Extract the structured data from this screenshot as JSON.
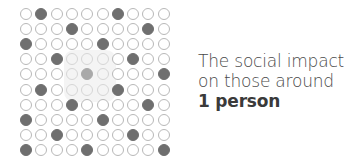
{
  "figure": {
    "grid": {
      "rows": 10,
      "cols": 10,
      "filled": [
        [
          2,
          7
        ],
        [
          4,
          9
        ],
        [
          1,
          6
        ],
        [
          3,
          8
        ],
        [
          10
        ],
        [
          2,
          7
        ],
        [
          4,
          9
        ],
        [
          1,
          6
        ],
        [
          3,
          8
        ],
        [
          1,
          5,
          10
        ]
      ],
      "highlighted_person": {
        "row": 5,
        "col": 5
      },
      "highlight_region": {
        "rows": [
          4,
          6
        ],
        "cols": [
          4,
          6
        ]
      },
      "colors": {
        "filled": "#6f6f6f",
        "outline": "#b8b8b8",
        "highlighted": "#a9a9a9"
      }
    },
    "caption": {
      "line1": "The social impact",
      "line2": "on those around",
      "line3": "1 person"
    }
  }
}
